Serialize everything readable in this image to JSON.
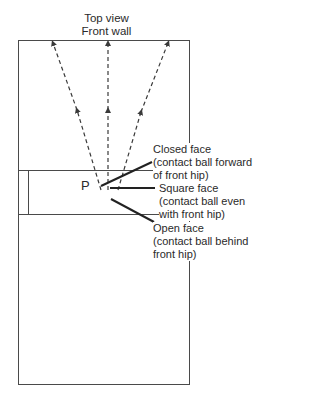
{
  "diagram": {
    "title_line1": "Top view",
    "title_line2": "Front wall",
    "player_label": "P",
    "labels": {
      "closed": {
        "title": "Closed face",
        "line1": "(contact ball forward",
        "line2": "of front hip)"
      },
      "square": {
        "title": "Square face",
        "line1": "(contact ball even",
        "line2": "with front hip)"
      },
      "open": {
        "title": "Open face",
        "line1": "(contact ball behind",
        "line2": "front hip)"
      }
    },
    "colors": {
      "line": "#3a3a3a",
      "background": "#ffffff"
    }
  }
}
